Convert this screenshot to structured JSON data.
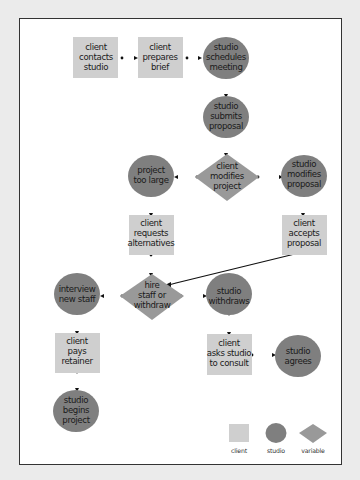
{
  "diagram": {
    "colors": {
      "client": "#cfcfcf",
      "studio": "#7f7f7f",
      "variable": "#999999",
      "panel": "#ffffff",
      "background": "#ebebeb",
      "connector": "#111111"
    },
    "nodes": [
      {
        "id": "n1",
        "type": "client",
        "lines": [
          "client",
          "contacts",
          "studio"
        ]
      },
      {
        "id": "n2",
        "type": "client",
        "lines": [
          "client",
          "prepares",
          "brief"
        ]
      },
      {
        "id": "n3",
        "type": "studio",
        "lines": [
          "studio",
          "schedules",
          "meeting"
        ]
      },
      {
        "id": "n4",
        "type": "studio",
        "lines": [
          "studio",
          "submits",
          "proposal"
        ]
      },
      {
        "id": "n5",
        "type": "studio",
        "lines": [
          "project",
          "too large"
        ]
      },
      {
        "id": "n6",
        "type": "variable",
        "lines": [
          "client",
          "modifies",
          "project"
        ]
      },
      {
        "id": "n7",
        "type": "studio",
        "lines": [
          "studio",
          "modifies",
          "proposal"
        ]
      },
      {
        "id": "n8",
        "type": "client",
        "lines": [
          "client",
          "requests",
          "alternatives"
        ]
      },
      {
        "id": "n9",
        "type": "client",
        "lines": [
          "client",
          "accepts",
          "proposal"
        ]
      },
      {
        "id": "n10",
        "type": "studio",
        "lines": [
          "interview",
          "new staff"
        ]
      },
      {
        "id": "n11",
        "type": "variable",
        "lines": [
          "hire",
          "staff or",
          "withdraw"
        ]
      },
      {
        "id": "n12",
        "type": "studio",
        "lines": [
          "studio",
          "withdraws"
        ]
      },
      {
        "id": "n13",
        "type": "client",
        "lines": [
          "client",
          "pays",
          "retainer"
        ]
      },
      {
        "id": "n14",
        "type": "client",
        "lines": [
          "client",
          "asks studio",
          "to consult"
        ]
      },
      {
        "id": "n15",
        "type": "studio",
        "lines": [
          "studio",
          "agrees"
        ]
      },
      {
        "id": "n16",
        "type": "studio",
        "lines": [
          "studio",
          "begins",
          "project"
        ]
      }
    ],
    "edges": [
      {
        "from": "n1",
        "to": "n2"
      },
      {
        "from": "n2",
        "to": "n3"
      },
      {
        "from": "n3",
        "to": "n4"
      },
      {
        "from": "n4",
        "to": "n6"
      },
      {
        "from": "n6",
        "to": "n5"
      },
      {
        "from": "n6",
        "to": "n7"
      },
      {
        "from": "n5",
        "to": "n8"
      },
      {
        "from": "n7",
        "to": "n9"
      },
      {
        "from": "n8",
        "to": "n11"
      },
      {
        "from": "n9",
        "to": "n11"
      },
      {
        "from": "n11",
        "to": "n10"
      },
      {
        "from": "n11",
        "to": "n12"
      },
      {
        "from": "n10",
        "to": "n13"
      },
      {
        "from": "n12",
        "to": "n14"
      },
      {
        "from": "n14",
        "to": "n15"
      },
      {
        "from": "n13",
        "to": "n16"
      }
    ],
    "legend": [
      {
        "type": "client",
        "label": "client"
      },
      {
        "type": "studio",
        "label": "studio"
      },
      {
        "type": "variable",
        "label": "variable"
      }
    ]
  }
}
